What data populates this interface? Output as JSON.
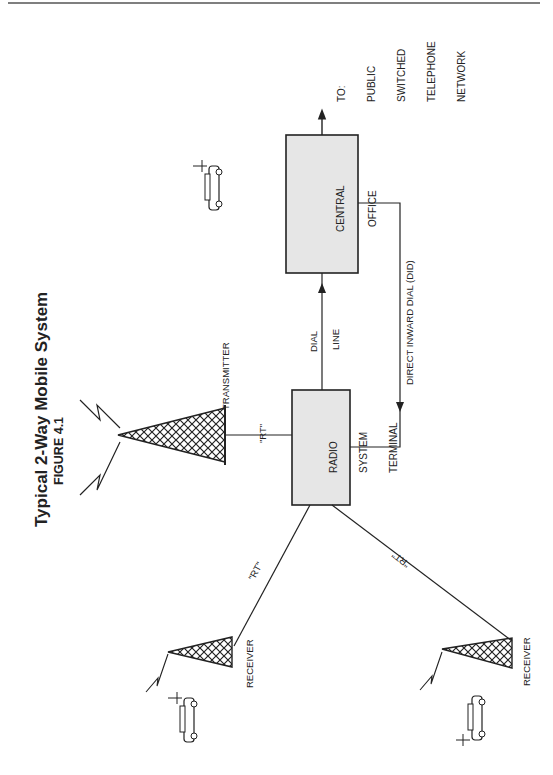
{
  "header": {
    "running_head": "58 WIRELESS DATA"
  },
  "figure": {
    "title": "Typical 2-Way Mobile System",
    "subtitle": "FIGURE 4.1"
  },
  "nodes": {
    "central_office": {
      "line1": "CENTRAL",
      "line2": "OFFICE"
    },
    "radio_terminal": {
      "line1": "RADIO",
      "line2": "SYSTEM",
      "line3": "TERMINAL"
    },
    "pstn": {
      "line1": "TO:",
      "line2": "PUBLIC",
      "line3": "SWITCHED",
      "line4": "TELEPHONE",
      "line5": "NETWORK"
    },
    "transmitter": {
      "label": "TRANSMITTER"
    },
    "receiver_1": {
      "label": "RECEIVER"
    },
    "receiver_2": {
      "label": "RECEIVER"
    }
  },
  "links": {
    "dial_line": {
      "line1": "DIAL",
      "line2": "LINE"
    },
    "did": {
      "label": "DIRECT INWARD DIAL (DID)"
    },
    "rt_transmitter": {
      "label": "\"RT\""
    },
    "rt_receiver_1": {
      "label": "\"RT\""
    },
    "rt_receiver_2": {
      "label": "\"RT\""
    }
  },
  "colors": {
    "box_fill": "#e6e6e6",
    "ink": "#222222"
  }
}
